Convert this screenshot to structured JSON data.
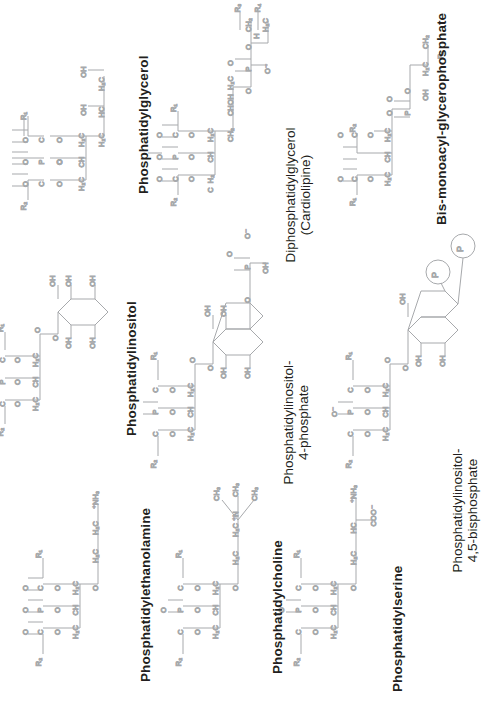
{
  "figure": {
    "type": "chemical-structure-diagram",
    "orientation": "rotated-90-ccw",
    "background_color": "#ffffff",
    "bond_color": "#a7a9ac",
    "atom_label_color": "#6d6e71",
    "name_label_color": "#231f20"
  },
  "structures": [
    {
      "id": "phosphatidylglycerol",
      "label": "Phosphatidylglycerol",
      "label_lines": [
        "Phosphatidylglycerol"
      ],
      "headgroup": "glycerol",
      "acyl_chains": [
        "R1",
        "R2"
      ],
      "atom_labels": [
        "O",
        "C",
        "R1",
        "O",
        "H2C",
        "CH",
        "H2C",
        "O",
        "C",
        "O",
        "R2",
        "P",
        "O",
        "O",
        "O",
        "H2C",
        "HC",
        "H2",
        "C",
        "OH",
        "OH"
      ]
    },
    {
      "id": "diphosphatidylglycerol",
      "label": "Diphosphatidylglycerol (Cardiolipine)",
      "label_lines": [
        "Diphosphatidylglycerol",
        "(Cardiolipine)"
      ],
      "headgroup": "glycerol-bis-phosphatidyl",
      "acyl_chains": [
        "R1",
        "R2",
        "R3",
        "R4"
      ],
      "atom_labels": [
        "O",
        "C",
        "R1",
        "R2",
        "R3",
        "R4",
        "P",
        "O",
        "CH2",
        "CHOH",
        "H2C",
        "CH2",
        "H2C",
        "HC"
      ]
    },
    {
      "id": "bis-monoacyl-glycerophosphate",
      "label": "Bis-monoacyl-glycerophosphate",
      "label_lines": [
        "Bis-monoacyl-glycerophosphate"
      ],
      "headgroup": "glycerophosphate",
      "acyl_chains": [
        "R1",
        "R2"
      ],
      "atom_labels": [
        "O",
        "C",
        "R1",
        "R2",
        "P",
        "O",
        "OH",
        "H2C",
        "HC",
        "CH2",
        "H2"
      ]
    },
    {
      "id": "phosphatidylinositol",
      "label": "Phosphatidylinositol",
      "label_lines": [
        "Phosphatidylinositol"
      ],
      "headgroup": "inositol",
      "acyl_chains": [
        "R1",
        "R2"
      ],
      "ring_substituents": [
        "OH",
        "OH",
        "OH",
        "OH",
        "OH"
      ],
      "atom_labels": [
        "O",
        "C",
        "R1",
        "R2",
        "P",
        "O",
        "H2C",
        "CH",
        "H2C"
      ]
    },
    {
      "id": "phosphatidylinositol-4-phosphate",
      "label": "Phosphatidylinositol-4-phosphate",
      "label_lines": [
        "Phosphatidylinositol-",
        "4-phosphate"
      ],
      "headgroup": "inositol-4-phosphate",
      "acyl_chains": [
        "R1",
        "R2"
      ],
      "ring_substituents": [
        "OH",
        "OH",
        "OH",
        "OH"
      ],
      "phosphate_groups": 1,
      "atom_labels": [
        "O",
        "C",
        "R1",
        "R2",
        "P",
        "O",
        "OH",
        "H2C",
        "CH",
        "H2C"
      ]
    },
    {
      "id": "phosphatidylinositol-4-5-bisphosphate",
      "label": "Phosphatidylinositol-4,5-bisphosphate",
      "label_lines": [
        "Phosphatidylinositol-",
        "4,5-bisphosphate"
      ],
      "headgroup": "inositol-4,5-bisphosphate",
      "acyl_chains": [
        "R1",
        "R2"
      ],
      "ring_substituents": [
        "OH",
        "OH",
        "OH"
      ],
      "phosphate_groups": 2,
      "phosphate_badge": "P",
      "atom_labels": [
        "O",
        "C",
        "R1",
        "R2",
        "P",
        "O",
        "H2C",
        "CH",
        "H2C"
      ]
    },
    {
      "id": "phosphatidylethanolamine",
      "label": "Phosphatidylethanolamine",
      "label_lines": [
        "Phosphatidylethanolamine"
      ],
      "headgroup": "ethanolamine",
      "acyl_chains": [
        "R1",
        "R2"
      ],
      "atom_labels": [
        "O",
        "C",
        "R1",
        "R2",
        "P",
        "O",
        "H2C",
        "CH",
        "H2C",
        "H2C",
        "H2C",
        "NH3"
      ]
    },
    {
      "id": "phosphatidylcholine",
      "label": "Phosphatidylcholine",
      "label_lines": [
        "Phosphatidylcholine"
      ],
      "headgroup": "choline",
      "acyl_chains": [
        "R1",
        "R2"
      ],
      "atom_labels": [
        "O",
        "C",
        "R1",
        "R2",
        "P",
        "O",
        "H2C",
        "CH",
        "H2C",
        "N",
        "CH3",
        "CH3",
        "CH3"
      ]
    },
    {
      "id": "phosphatidylserine",
      "label": "Phosphatidylserine",
      "label_lines": [
        "Phosphatidylserine"
      ],
      "headgroup": "serine",
      "acyl_chains": [
        "R1",
        "R2"
      ],
      "atom_labels": [
        "O",
        "C",
        "R1",
        "R2",
        "P",
        "O",
        "H2C",
        "CH",
        "H2C",
        "HC",
        "NH3",
        "COO"
      ]
    }
  ],
  "glyphs": {
    "O": "O",
    "C": "C",
    "P": "P",
    "N": "N",
    "OH": "OH",
    "CH": "CH",
    "CHOH": "CHOH",
    "H2C": "H₂C",
    "CH2": "CH₂",
    "CH3": "CH₃",
    "HC": "HC",
    "H2": "H₂",
    "NH3p": "⁺NH₃",
    "COOm": "COO⁻",
    "Om": "O⁻",
    "R1": "R₁",
    "R2": "R₂",
    "R3": "R₃",
    "R4": "R₄",
    "P_circle": "P"
  }
}
